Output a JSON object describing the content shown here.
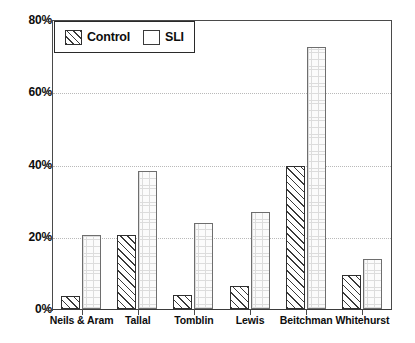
{
  "chart_data": {
    "type": "bar",
    "title": "",
    "xlabel": "",
    "ylabel": "",
    "ylim": [
      0,
      80
    ],
    "yticks": [
      0,
      20,
      40,
      60,
      80
    ],
    "ytick_labels": [
      "0%",
      "20%",
      "40%",
      "60%",
      "80%"
    ],
    "grid": "horizontal dotted gridlines at 20%, 40%, 60%",
    "legend_position": "top-left inside plot area",
    "categories": [
      "Neils & Aram",
      "Tallal",
      "Tomblin",
      "Lewis",
      "Beitchman",
      "Whitehurst"
    ],
    "series": [
      {
        "name": "Control",
        "fill": "diagonal-hatch",
        "values": [
          3.5,
          20.5,
          4,
          6.5,
          40,
          9.5
        ]
      },
      {
        "name": "SLI",
        "fill": "light-grid",
        "values": [
          20.5,
          38.5,
          24,
          27,
          73,
          14
        ]
      }
    ]
  },
  "legend": {
    "entries": [
      {
        "label": "Control",
        "icon": "hatched-swatch-icon"
      },
      {
        "label": "SLI",
        "icon": "plain-swatch-icon"
      }
    ]
  },
  "colors": {
    "axis": "#4a4a4a",
    "gridline": "#b9b9b9",
    "control_edge": "#2f2f2f",
    "sli_edge": "#6e6e6e",
    "text": "#0d0d0d",
    "background": "#ffffff"
  }
}
